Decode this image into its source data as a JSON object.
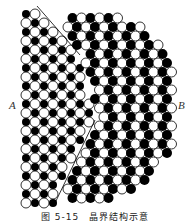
{
  "figure": {
    "label_left": "A",
    "label_right": "B",
    "caption": "图 5-15　晶界结构示意",
    "colors": {
      "atom_dark": "#000000",
      "atom_light": "#ffffff",
      "outline": "#000000",
      "background": "#ffffff"
    },
    "grain_a": {
      "pitch": 9,
      "atom_radius": 5
    },
    "grain_b": {
      "pitch": 9,
      "atom_radius": 5,
      "rotation_deg": 0
    }
  }
}
